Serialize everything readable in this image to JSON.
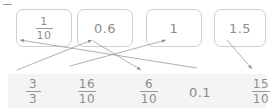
{
  "exercise": {
    "kind": "matching-diagram",
    "background_color": "#ffffff",
    "band_color": "#f4f4f4",
    "ink_color": "#8d8d8d",
    "box_border_color": "#cfcfcf",
    "arrow_color": "#8f8f8f",
    "corner_mark": ""
  },
  "top_options": [
    {
      "id": "opt-1",
      "type": "fraction",
      "numerator": "1",
      "denominator": "10",
      "label": "1/10"
    },
    {
      "id": "opt-2",
      "type": "decimal",
      "value": "0.6",
      "label": "0.6"
    },
    {
      "id": "opt-3",
      "type": "whole",
      "value": "1",
      "label": "1"
    },
    {
      "id": "opt-4",
      "type": "decimal",
      "value": "1.5",
      "label": "1.5"
    }
  ],
  "bottom_answers": [
    {
      "id": "ans-1",
      "type": "fraction",
      "numerator": "3",
      "denominator": "3",
      "label": "3/3"
    },
    {
      "id": "ans-2",
      "type": "fraction",
      "numerator": "16",
      "denominator": "10",
      "label": "16/10"
    },
    {
      "id": "ans-3",
      "type": "fraction",
      "numerator": "6",
      "denominator": "10",
      "label": "6/10"
    },
    {
      "id": "ans-4",
      "type": "decimal",
      "value": "0.1",
      "label": "0.1"
    },
    {
      "id": "ans-5",
      "type": "fraction",
      "numerator": "15",
      "denominator": "10",
      "label": "15/10"
    }
  ],
  "connections": [
    {
      "id": "conn-1",
      "from": "0.1",
      "to": "1/10",
      "x1": 197,
      "y1": 68,
      "x2": 20,
      "y2": 40,
      "arrow_at": "to"
    },
    {
      "id": "conn-2",
      "from": "3/3",
      "to": "0.6",
      "x1": 17,
      "y1": 70,
      "x2": 92,
      "y2": 40,
      "arrow_at": "to"
    },
    {
      "id": "conn-3",
      "from": "0.6",
      "to": "6/10",
      "x1": 93,
      "y1": 41,
      "x2": 141,
      "y2": 70,
      "arrow_at": "to"
    },
    {
      "id": "conn-4",
      "from": "16/10",
      "to": "1",
      "x1": 70,
      "y1": 66,
      "x2": 166,
      "y2": 40,
      "arrow_at": "to"
    },
    {
      "id": "conn-5",
      "from": "1.5",
      "to": "15/10",
      "x1": 227,
      "y1": 40,
      "x2": 252,
      "y2": 69,
      "arrow_at": "to"
    }
  ]
}
